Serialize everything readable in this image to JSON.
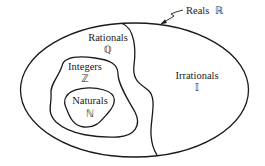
{
  "diagram": {
    "type": "nested-sets-venn",
    "colors": {
      "stroke": "#1a1a1a",
      "background": "#ffffff",
      "text": "#1a1a1a"
    },
    "sets": [
      {
        "id": "reals",
        "label": "Reals",
        "symbol": "ℝ"
      },
      {
        "id": "rationals",
        "label": "Rationals",
        "symbol": "ℚ"
      },
      {
        "id": "integers",
        "label": "Integers",
        "symbol": "ℤ"
      },
      {
        "id": "naturals",
        "label": "Naturals",
        "symbol": "ℕ"
      },
      {
        "id": "irrationals",
        "label": "Irrationals",
        "symbol": "𝕀"
      }
    ],
    "relations": [
      "Naturals ⊂ Integers",
      "Integers ⊂ Rationals",
      "Rationals ⊂ Reals",
      "Irrationals ⊂ Reals",
      "Rationals ∩ Irrationals = ∅"
    ]
  }
}
